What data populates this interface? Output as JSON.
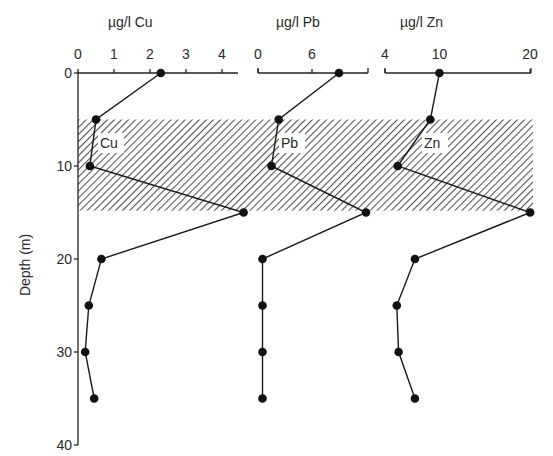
{
  "chart_data": {
    "type": "line",
    "title": "",
    "ylabel": "Depth (m)",
    "y": {
      "label": "Depth (m)",
      "ticks": [
        0,
        10,
        20,
        30,
        40
      ],
      "range": [
        0,
        40
      ],
      "inverted": true
    },
    "shaded_band": {
      "depth_from": 5,
      "depth_to": 14.8,
      "pattern": "diagonal-hatch"
    },
    "depths": [
      0,
      5,
      10,
      15,
      20,
      25,
      30,
      35
    ],
    "series": [
      {
        "name": "Cu",
        "axis_label": "µg/l Cu",
        "inline_label": "Cu",
        "xticks": [
          0,
          1,
          2,
          3,
          4
        ],
        "xrange": [
          0,
          4.4
        ],
        "values": [
          2.3,
          0.5,
          0.33,
          4.6,
          0.65,
          0.3,
          0.2,
          0.45
        ]
      },
      {
        "name": "Pb",
        "axis_label": "µg/l Pb",
        "inline_label": "Pb",
        "xticks": [
          0,
          6
        ],
        "xrange": [
          0,
          12.2
        ],
        "values": [
          9,
          2.3,
          1.5,
          12,
          0.5,
          0.5,
          0.5,
          0.5
        ]
      },
      {
        "name": "Zn",
        "axis_label": "µg/l Zn",
        "inline_label": "Zn",
        "xticks": [
          4,
          10,
          20
        ],
        "xrange": [
          4,
          20
        ],
        "values": [
          10,
          9,
          5.4,
          20,
          7.3,
          5.3,
          5.5,
          7.3
        ]
      }
    ],
    "grid": false,
    "legend": "none (inline labels)"
  },
  "labels": {
    "cu_title": "µg/l Cu",
    "pb_title": "µg/l Pb",
    "zn_title": "µg/l Zn",
    "cu_inline": "Cu",
    "pb_inline": "Pb",
    "zn_inline": "Zn",
    "depth_label": "Depth (m)",
    "depth_ticks": [
      "0",
      "10",
      "20",
      "30",
      "40"
    ],
    "cu_ticks": [
      "0",
      "1",
      "2",
      "3",
      "4"
    ],
    "pb_ticks": [
      "0",
      "6"
    ],
    "zn_ticks": [
      "4",
      "10",
      "20"
    ]
  }
}
